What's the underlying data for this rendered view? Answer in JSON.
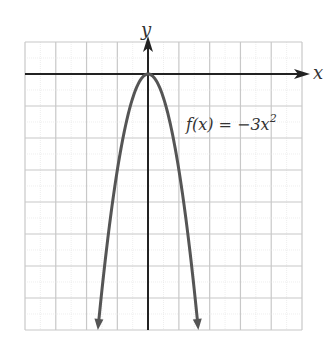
{
  "chart_data": {
    "type": "line",
    "title": "",
    "xlabel": "x",
    "ylabel": "y",
    "xlim": [
      -4,
      5
    ],
    "ylim": [
      -8,
      1
    ],
    "grid": true,
    "series": [
      {
        "name": "f(x) = -3x^2",
        "equation": "f(x) = -3x^2",
        "x": [
          -1.633,
          -1.5,
          -1,
          -0.5,
          0,
          0.5,
          1,
          1.5,
          1.633
        ],
        "values": [
          -8,
          -6.75,
          -3,
          -0.75,
          0,
          -0.75,
          -3,
          -6.75,
          -8
        ]
      }
    ],
    "annotations": [
      {
        "text_main": "f(x) = −3x",
        "text_sup": "2",
        "x": 1.4,
        "y": -1.6
      }
    ],
    "colors": {
      "curve": "#555555",
      "axis": "#222222",
      "grid": "#c8c8c8"
    }
  },
  "labels": {
    "x_axis": "x",
    "y_axis": "y",
    "function_main": "f(x) = −3x",
    "function_sup": "2"
  }
}
